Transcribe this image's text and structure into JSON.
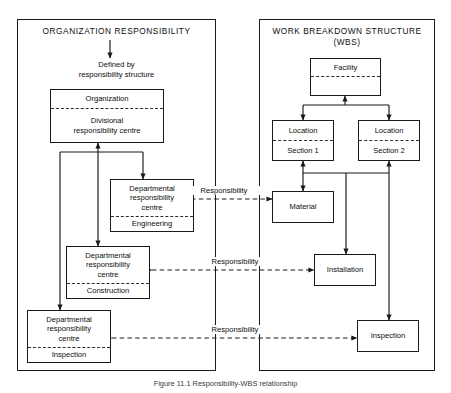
{
  "diagram": {
    "caption": "Figure 11.1  Responsibility-WBS relationship",
    "stroke_color": "#1a1a1a",
    "background_color": "#ffffff"
  },
  "panels": [
    {
      "id": "organization-responsibility",
      "title": "ORGANIZATION RESPONSIBILITY"
    },
    {
      "id": "work-breakdown-structure",
      "title_line1": "WORK BREAKDOWN STRUCTURE",
      "title_line2": "(WBS)"
    }
  ],
  "left": {
    "note_line1": "Defined by",
    "note_line2": "responsibility structure",
    "organization": {
      "top": "Organization",
      "bottom_line1": "Divisional",
      "bottom_line2": "responsibility centre"
    },
    "departments": [
      {
        "top_line1": "Departmental",
        "top_line2": "responsibility",
        "top_line3": "centre",
        "bottom": "Engineering"
      },
      {
        "top_line1": "Departmental",
        "top_line2": "responsibility",
        "top_line3": "centre",
        "bottom": "Construction"
      },
      {
        "top_line1": "Departmental",
        "top_line2": "responsibility",
        "top_line3": "centre",
        "bottom": "Inspection"
      }
    ]
  },
  "right": {
    "facility": {
      "top": "Facility",
      "bottom": ""
    },
    "locations": [
      {
        "top": "Location",
        "bottom": "Section 1"
      },
      {
        "top": "Location",
        "bottom": "Section 2"
      }
    ],
    "work_items": [
      {
        "label": "Material"
      },
      {
        "label": "Installation"
      },
      {
        "label": "Inspection"
      }
    ]
  },
  "links": [
    {
      "label": "Responsibility",
      "from": "Engineering",
      "to": "Material"
    },
    {
      "label": "Responsibility",
      "from": "Construction",
      "to": "Installation"
    },
    {
      "label": "Responsibility",
      "from": "Inspection",
      "to": "Inspection"
    }
  ]
}
